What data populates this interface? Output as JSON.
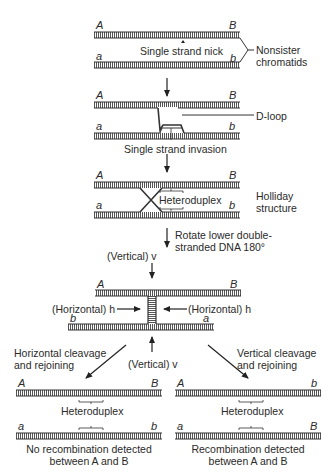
{
  "diagram": {
    "stages": [
      {
        "id": "stage1",
        "labels": {
          "top_left": "A",
          "top_right": "B",
          "bottom_left": "a",
          "bottom_right": "b",
          "nick": "Single strand nick",
          "side": "Nonsister\nchromatids"
        }
      },
      {
        "id": "stage2",
        "labels": {
          "top_left": "A",
          "top_right": "B",
          "bottom_left": "a",
          "bottom_right": "b",
          "dloop": "D-loop",
          "caption": "Single strand invasion"
        }
      },
      {
        "id": "stage3",
        "labels": {
          "top_left": "A",
          "top_right": "B",
          "bottom_left": "a",
          "bottom_right": "b",
          "heteroduplex": "Heteroduplex",
          "side": "Holliday\nstructure",
          "rotate": "Rotate lower double-\nstranded DNA 180°"
        }
      },
      {
        "id": "stage4",
        "labels": {
          "vertical_top": "(Vertical) v",
          "top_left": "A",
          "top_right": "B",
          "horiz_left": "(Horizontal) h",
          "horiz_right": "(Horizontal) h",
          "bottom_left": "b",
          "bottom_right": "a",
          "vertical_bottom": "(Vertical) v"
        }
      },
      {
        "id": "result_left",
        "labels": {
          "path": "Horizontal cleavage\nand rejoining",
          "top_left": "A",
          "top_right": "B",
          "bottom_left": "a",
          "bottom_right": "b",
          "heteroduplex": "Heteroduplex",
          "caption": "No recombination detected\nbetween A and B"
        }
      },
      {
        "id": "result_right",
        "labels": {
          "path": "Vertical cleavage\nand rejoining",
          "top_left": "A",
          "top_right": "b",
          "bottom_left": "a",
          "bottom_right": "B",
          "heteroduplex": "Heteroduplex",
          "caption": "Recombination detected\nbetween A and B"
        }
      }
    ],
    "colors": {
      "strand": "#3a3a3a",
      "text": "#2a2a2a",
      "background": "#ffffff"
    }
  }
}
